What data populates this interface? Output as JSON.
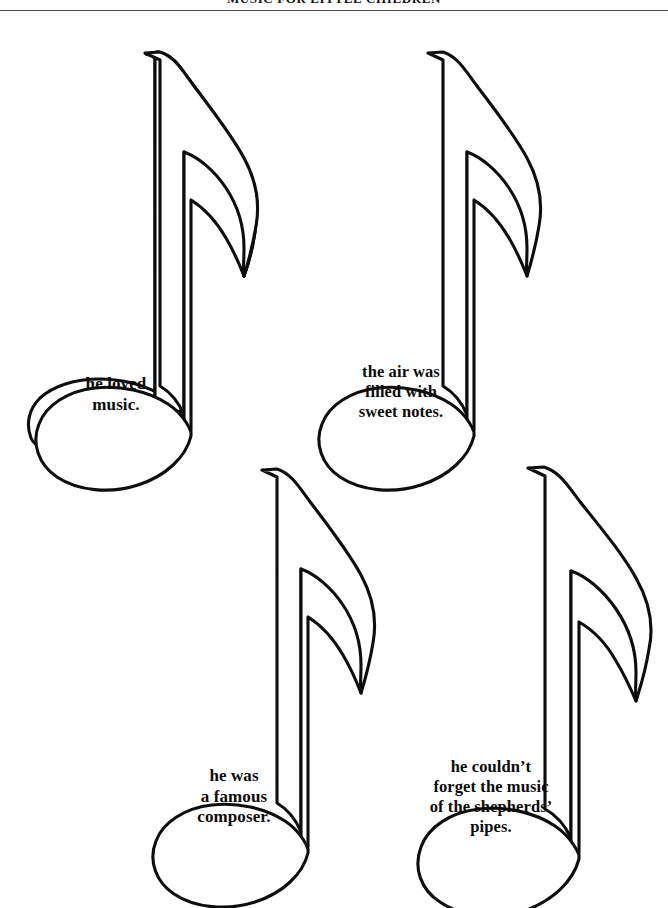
{
  "header": {
    "title": "MUSIC FOR LITTLE CHILDREN",
    "rule": "horizontal-rule"
  },
  "page": {
    "background_color": "#ffffff",
    "ink_color": "#0d0d0d",
    "width": 668,
    "height": 908,
    "worksheet_type": "eighth-note-cutouts-with-sentences"
  },
  "notes": [
    {
      "id": "note-1",
      "icon": "eighth-note-icon",
      "position": "top-left",
      "caption": "he loved\nmusic."
    },
    {
      "id": "note-2",
      "icon": "eighth-note-icon",
      "position": "top-right",
      "caption": "the air was\nfilled with\nsweet notes."
    },
    {
      "id": "note-3",
      "icon": "eighth-note-icon",
      "position": "bottom-left",
      "caption": "he was\na famous\ncomposer."
    },
    {
      "id": "note-4",
      "icon": "eighth-note-icon",
      "position": "bottom-right",
      "caption": "he couldn’t\nforget the music\nof the shepherds’\npipes."
    }
  ]
}
